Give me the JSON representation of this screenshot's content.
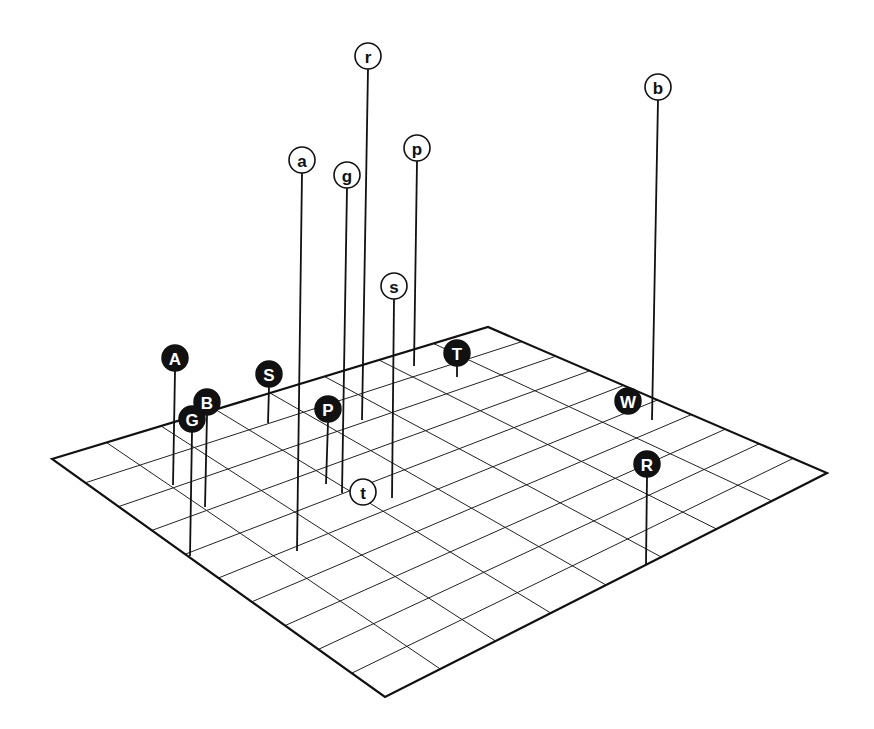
{
  "figure": {
    "canvas": {
      "width": 874,
      "height": 729
    },
    "plane": {
      "corners": {
        "left": [
          52,
          459
        ],
        "top": [
          488,
          327
        ],
        "right": [
          827,
          473
        ],
        "bottom": [
          385,
          697
        ]
      },
      "divisions_left_to_top": 8,
      "divisions_top_to_right": 10
    },
    "colors": {
      "ink": "#111111",
      "background": "#ffffff",
      "dark_marker_fill": "#111111",
      "dark_marker_text": "#ffffff",
      "light_marker_fill": "#ffffff",
      "light_marker_text": "#111111"
    },
    "marker_radius": 13
  },
  "markers": [
    {
      "label": "r",
      "style": "light",
      "cx": 368,
      "cy": 56,
      "base": [
        362,
        420
      ]
    },
    {
      "label": "b",
      "style": "light",
      "cx": 658,
      "cy": 87,
      "base": [
        652,
        420
      ]
    },
    {
      "label": "p",
      "style": "light",
      "cx": 417,
      "cy": 148,
      "base": [
        414,
        366
      ]
    },
    {
      "label": "a",
      "style": "light",
      "cx": 302,
      "cy": 160,
      "base": [
        297,
        551
      ]
    },
    {
      "label": "g",
      "style": "light",
      "cx": 347,
      "cy": 175,
      "base": [
        342,
        493
      ]
    },
    {
      "label": "s",
      "style": "light",
      "cx": 394,
      "cy": 286,
      "base": [
        392,
        498
      ]
    },
    {
      "label": "T",
      "style": "dark",
      "cx": 457,
      "cy": 353,
      "base": [
        457,
        377
      ]
    },
    {
      "label": "A",
      "style": "dark",
      "cx": 175,
      "cy": 358,
      "base": [
        173,
        485
      ]
    },
    {
      "label": "S",
      "style": "dark",
      "cx": 269,
      "cy": 374,
      "base": [
        268,
        423
      ]
    },
    {
      "label": "W",
      "style": "dark",
      "cx": 628,
      "cy": 401,
      "base": null
    },
    {
      "label": "B",
      "style": "dark",
      "cx": 207,
      "cy": 402,
      "base": [
        205,
        507
      ]
    },
    {
      "label": "P",
      "style": "dark",
      "cx": 328,
      "cy": 409,
      "base": [
        326,
        484
      ]
    },
    {
      "label": "G",
      "style": "dark",
      "cx": 192,
      "cy": 419,
      "base": [
        190,
        556
      ]
    },
    {
      "label": "R",
      "style": "dark",
      "cx": 647,
      "cy": 464,
      "base": [
        646,
        565
      ]
    },
    {
      "label": "t",
      "style": "light",
      "cx": 363,
      "cy": 492,
      "base": null
    }
  ]
}
